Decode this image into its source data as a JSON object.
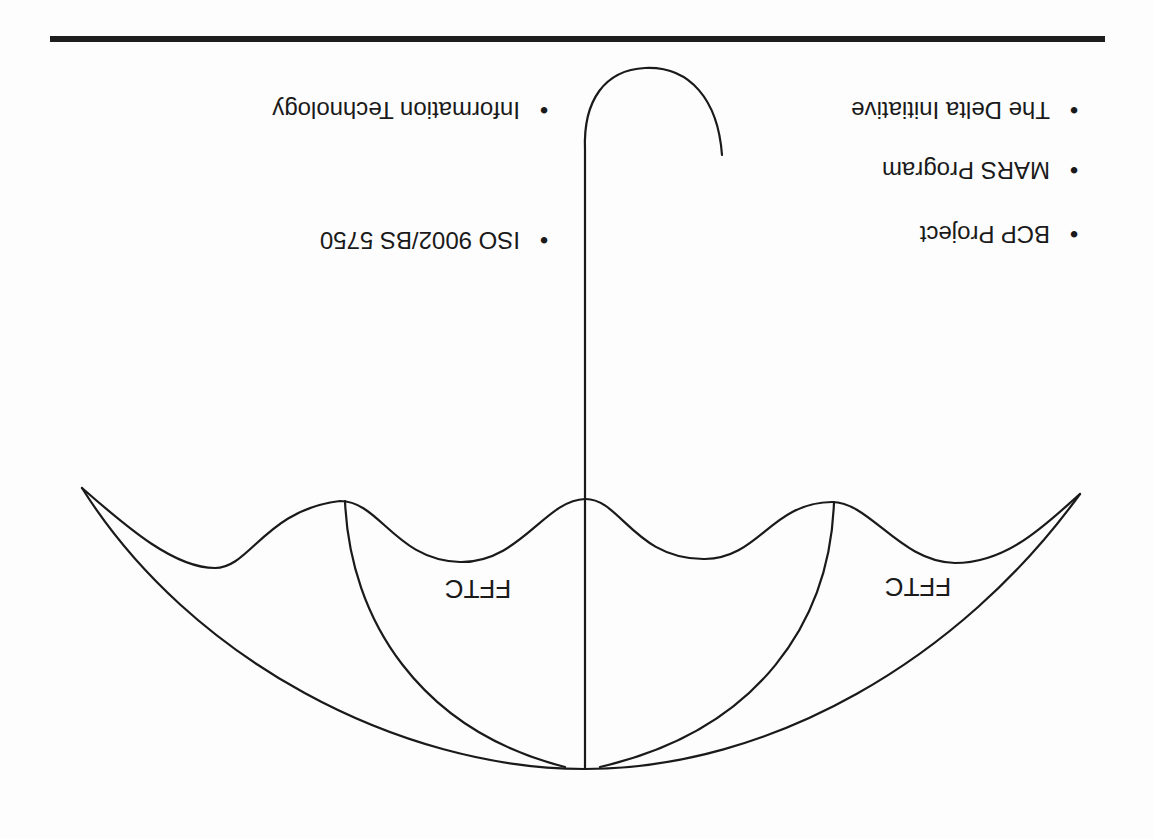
{
  "slide": {
    "orientation": "rotated-180",
    "title_rule_color": "#1e1e1e",
    "diagram": {
      "type": "umbrella",
      "panel_labels": [
        "FFTC",
        "FFTC"
      ]
    },
    "left_column_bullets": [
      {
        "label": "The Delta Initiative"
      },
      {
        "label": "MARS Program"
      },
      {
        "label": "BCP Project"
      }
    ],
    "right_column_bullets": [
      {
        "label": "Information Technology"
      },
      {
        "label": "ISO 9002/BS 5750"
      }
    ],
    "bullet_glyph": "•"
  }
}
